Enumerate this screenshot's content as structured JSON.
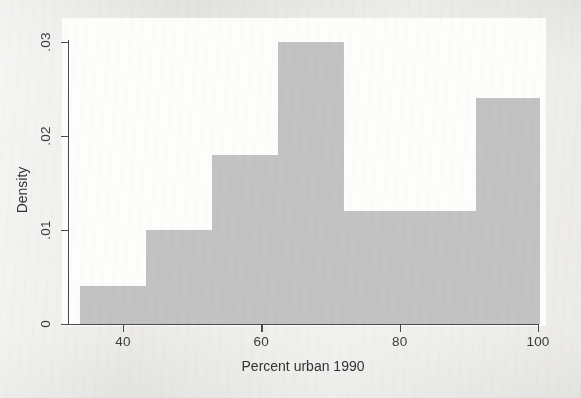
{
  "chart_data": {
    "type": "bar",
    "title": "",
    "xlabel": "Percent urban 1990",
    "ylabel": "Density",
    "xlim": [
      33.8,
      100.2
    ],
    "ylim": [
      0,
      0.0315
    ],
    "grid": false,
    "legend": null,
    "bin_width": 9.55,
    "bar_color": "#c2c2c2",
    "axis_color": "#4a4a4a",
    "background_color": "#ecebe8",
    "plot_background_color": "#fdfdfc",
    "xticks": [
      "40",
      "60",
      "80",
      "100"
    ],
    "xtick_values": [
      40,
      60,
      80,
      100
    ],
    "yticks": [
      "0",
      ".01",
      ".02",
      ".03"
    ],
    "ytick_values": [
      0,
      0.01,
      0.02,
      0.03
    ],
    "bins": [
      {
        "left": 33.8,
        "right": 43.35,
        "density": 0.004
      },
      {
        "left": 43.35,
        "right": 52.9,
        "density": 0.01
      },
      {
        "left": 52.9,
        "right": 62.45,
        "density": 0.018
      },
      {
        "left": 62.45,
        "right": 72.0,
        "density": 0.03
      },
      {
        "left": 72.0,
        "right": 81.55,
        "density": 0.012
      },
      {
        "left": 81.55,
        "right": 91.1,
        "density": 0.012
      },
      {
        "left": 91.1,
        "right": 100.65,
        "density": 0.024
      }
    ],
    "categories": [
      "33.8-43.4",
      "43.4-52.9",
      "52.9-62.5",
      "62.5-72.0",
      "72.0-81.6",
      "81.6-91.1",
      "91.1-100.7"
    ],
    "values": [
      0.004,
      0.01,
      0.018,
      0.03,
      0.012,
      0.012,
      0.024
    ]
  }
}
